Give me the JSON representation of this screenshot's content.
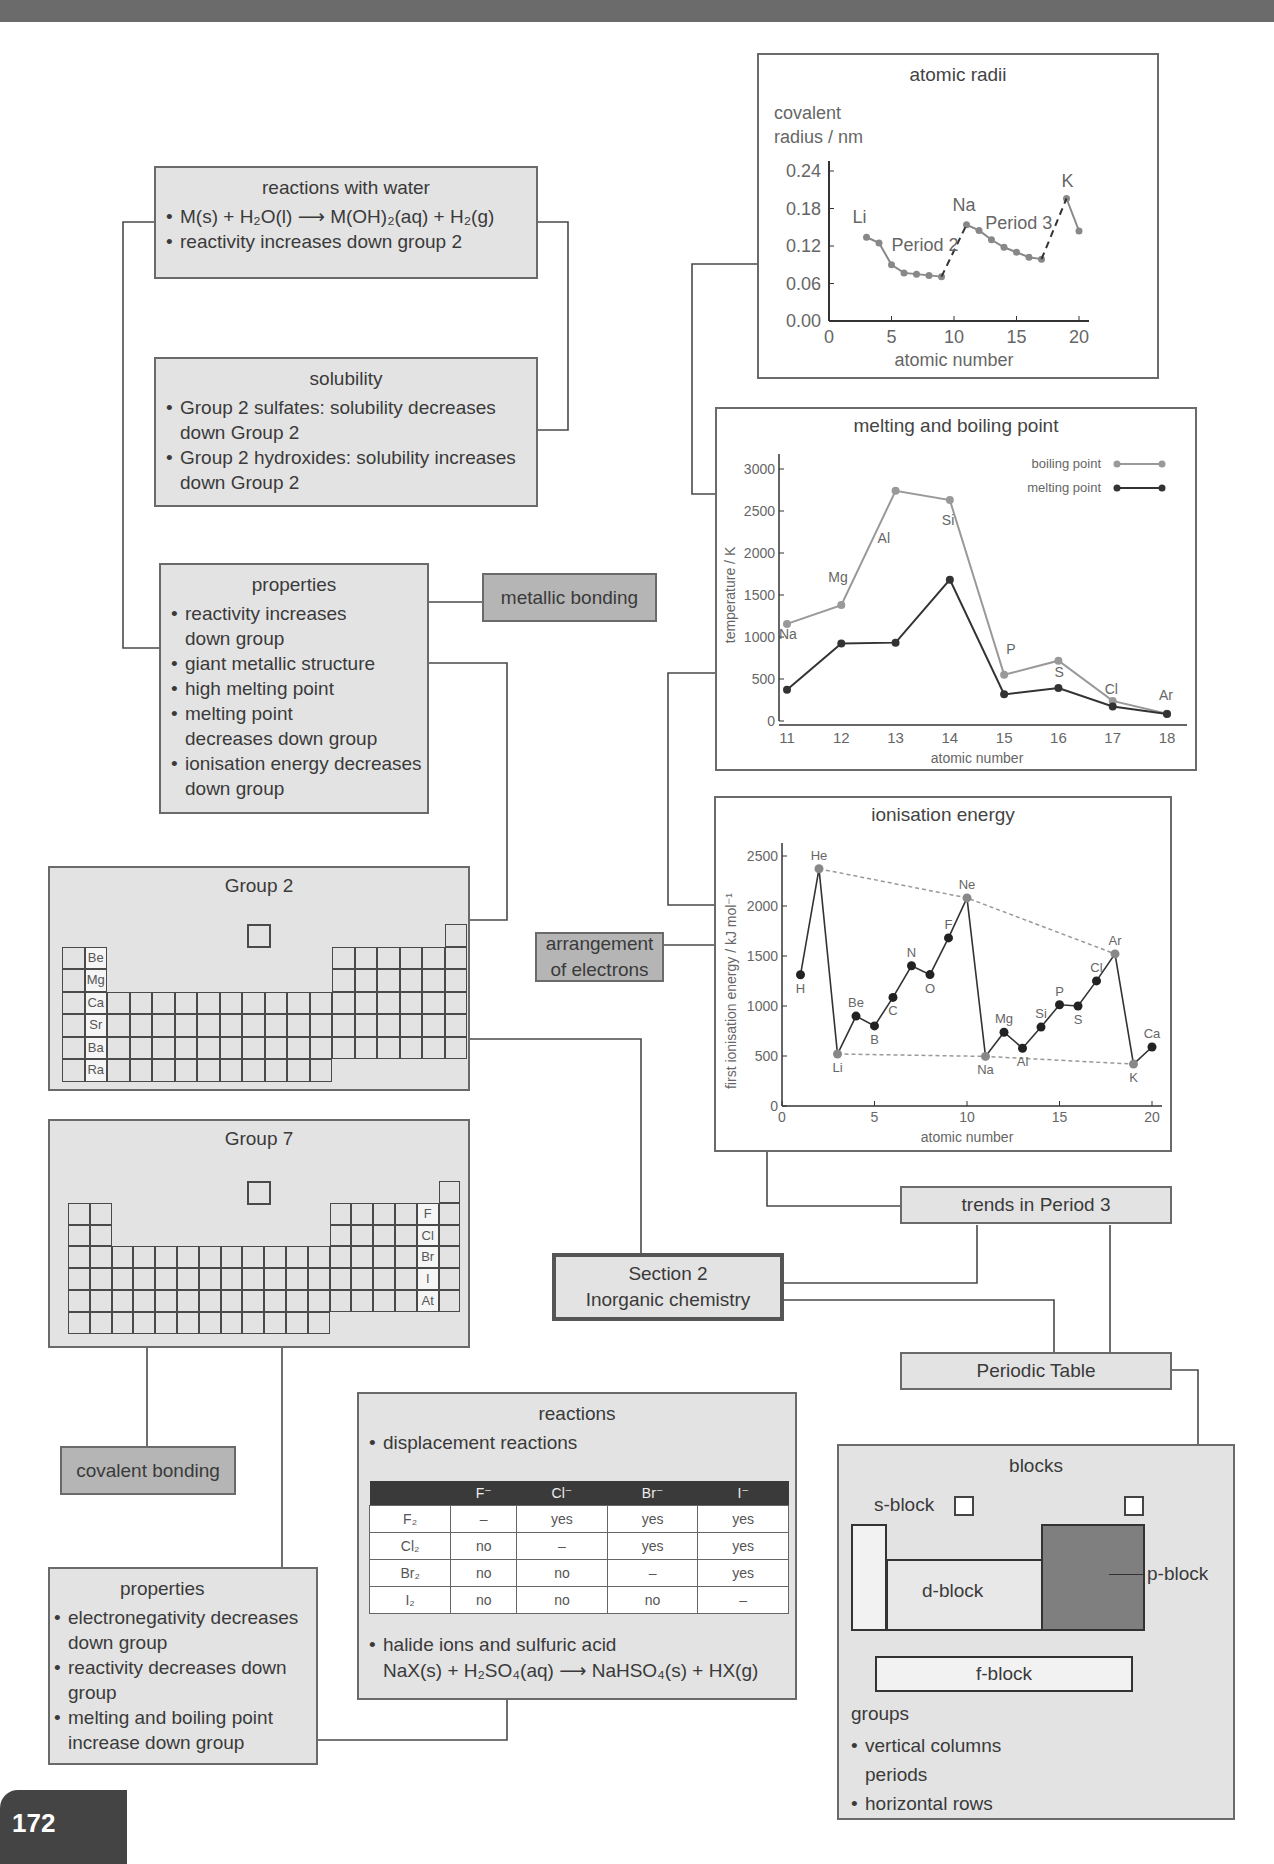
{
  "page_number": "172",
  "central": {
    "line1": "Section 2",
    "line2": "Inorganic chemistry"
  },
  "reactions_with_water": {
    "title": "reactions with water",
    "items": [
      "M(s) + H₂O(l) ⟶ M(OH)₂(aq) + H₂(g)",
      "reactivity increases down group 2"
    ]
  },
  "solubility": {
    "title": "solubility",
    "items": [
      "Group 2 sulfates: solubility decreases down Group 2",
      "Group 2 hydroxides: solubility increases down Group 2"
    ]
  },
  "group2_properties": {
    "title": "properties",
    "items": [
      "reactivity increases down group",
      "giant metallic structure",
      "high melting point",
      "melting point decreases down group",
      "ionisation energy decreases down group"
    ]
  },
  "metallic_bonding": "metallic bonding",
  "group2": {
    "title": "Group 2",
    "elements": [
      "Be",
      "Mg",
      "Ca",
      "Sr",
      "Ba",
      "Ra"
    ]
  },
  "group7": {
    "title": "Group 7",
    "elements": [
      "F",
      "Cl",
      "Br",
      "I",
      "At"
    ]
  },
  "arrangement_of_electrons": {
    "line1": "arrangement",
    "line2": "of electrons"
  },
  "covalent_bonding": "covalent bonding",
  "group7_properties": {
    "title": "properties",
    "items": [
      "electronegativity decreases down group",
      "reactivity decreases down group",
      "melting and boiling point increase down group"
    ]
  },
  "reactions": {
    "title": "reactions",
    "bullet1": "displacement reactions",
    "table": {
      "headers": [
        "",
        "F⁻",
        "Cl⁻",
        "Br⁻",
        "I⁻"
      ],
      "rows": [
        [
          "F₂",
          "–",
          "yes",
          "yes",
          "yes"
        ],
        [
          "Cl₂",
          "no",
          "–",
          "yes",
          "yes"
        ],
        [
          "Br₂",
          "no",
          "no",
          "–",
          "yes"
        ],
        [
          "I₂",
          "no",
          "no",
          "no",
          "–"
        ]
      ]
    },
    "bullet2": "halide ions and sulfuric acid",
    "equation": "NaX(s) + H₂SO₄(aq) ⟶ NaHSO₄(s) + HX(g)"
  },
  "trends_in_period_3": "trends in Period 3",
  "periodic_table": "Periodic Table",
  "blocks": {
    "title": "blocks",
    "s_block": "s-block",
    "d_block": "d-block",
    "p_block": "p-block",
    "f_block": "f-block",
    "groups_label": "groups",
    "groups_desc": "vertical columns",
    "periods_label": "periods",
    "periods_desc": "horizontal rows"
  },
  "chart_data": [
    {
      "type": "line",
      "title": "atomic radii",
      "xlabel": "atomic number",
      "ylabel": "covalent radius / nm",
      "xlim": [
        0,
        20
      ],
      "ylim": [
        0,
        0.24
      ],
      "xticks": [
        0,
        5,
        10,
        15,
        20
      ],
      "yticks": [
        "0.00",
        "0.06",
        "0.12",
        "0.18",
        "0.24"
      ],
      "series": [
        {
          "name": "Period 2",
          "x": [
            3,
            4,
            5,
            6,
            7,
            8,
            9
          ],
          "values": [
            0.134,
            0.125,
            0.09,
            0.077,
            0.075,
            0.073,
            0.071
          ]
        },
        {
          "name": "Period 3",
          "x": [
            11,
            12,
            13,
            14,
            15,
            16,
            17
          ],
          "values": [
            0.154,
            0.145,
            0.13,
            0.118,
            0.11,
            0.102,
            0.099
          ]
        },
        {
          "name": "Period 4",
          "x": [
            19,
            20
          ],
          "values": [
            0.196,
            0.144
          ]
        }
      ],
      "dashed_links": [
        [
          9,
          0.071,
          11,
          0.154
        ],
        [
          17,
          0.099,
          19,
          0.196
        ]
      ],
      "annotations": [
        "Li",
        "Period 2",
        "Na",
        "Period 3",
        "K"
      ]
    },
    {
      "type": "line",
      "title": "melting and boiling point",
      "xlabel": "atomic number",
      "ylabel": "temperature / K",
      "categories": [
        11,
        12,
        13,
        14,
        15,
        16,
        17,
        18
      ],
      "element_labels": [
        "Na",
        "Mg",
        "Al",
        "Si",
        "P",
        "S",
        "Cl",
        "Ar"
      ],
      "ylim": [
        0,
        3000
      ],
      "yticks": [
        0,
        500,
        1000,
        1500,
        2000,
        2500,
        3000
      ],
      "legend": [
        "boiling point",
        "melting point"
      ],
      "legend_position": "top-right",
      "series": [
        {
          "name": "boiling point",
          "values": [
            1156,
            1380,
            2740,
            2630,
            550,
            718,
            239,
            87
          ]
        },
        {
          "name": "melting point",
          "values": [
            371,
            922,
            933,
            1683,
            317,
            392,
            172,
            84
          ]
        }
      ]
    },
    {
      "type": "line",
      "title": "ionisation energy",
      "xlabel": "atomic number",
      "ylabel": "first ionisation energy / kJ mol⁻¹",
      "xlim": [
        0,
        20
      ],
      "ylim": [
        0,
        2500
      ],
      "xticks": [
        0,
        5,
        10,
        15,
        20
      ],
      "yticks": [
        0,
        500,
        1000,
        1500,
        2000,
        2500
      ],
      "element_labels": [
        "H",
        "He",
        "Li",
        "Be",
        "B",
        "C",
        "N",
        "O",
        "F",
        "Ne",
        "Na",
        "Mg",
        "Al",
        "Si",
        "P",
        "S",
        "Cl",
        "Ar",
        "K",
        "Ca"
      ],
      "x": [
        1,
        2,
        3,
        4,
        5,
        6,
        7,
        8,
        9,
        10,
        11,
        12,
        13,
        14,
        15,
        16,
        17,
        18,
        19,
        20
      ],
      "values": [
        1312,
        2372,
        520,
        899,
        801,
        1086,
        1402,
        1314,
        1681,
        2081,
        496,
        738,
        578,
        789,
        1012,
        1000,
        1251,
        1521,
        419,
        590
      ],
      "dashed_trends": [
        [
          "He",
          "Ne",
          "Ar"
        ],
        [
          "Li",
          "Na",
          "K"
        ]
      ]
    }
  ]
}
